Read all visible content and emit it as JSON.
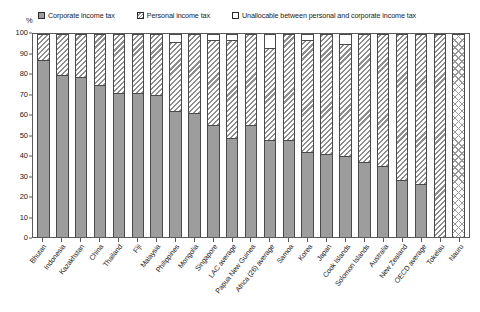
{
  "chart_data": {
    "type": "bar",
    "subtype": "stacked-100-percent",
    "title": "",
    "xlabel": "",
    "ylabel": "%",
    "ylim": [
      0,
      100
    ],
    "yticks": [
      0,
      10,
      20,
      30,
      40,
      50,
      60,
      70,
      80,
      90,
      100
    ],
    "grid": false,
    "legend_position": "top",
    "unit": "%",
    "categories": [
      "Bhutan",
      "Indonesia",
      "Kazakhstan",
      "China",
      "Thailand",
      "Fiji",
      "Malaysia",
      "Philippines",
      "Mongolia",
      "Singapore",
      "LAC average",
      "Papua New Guinea",
      "Africa (26) average",
      "Samoa",
      "Korea",
      "Japan",
      "Cook Islands",
      "Solomon Islands",
      "Australia",
      "New Zealand",
      "OECD average",
      "Tokelau",
      "Nauru"
    ],
    "series": [
      {
        "name": "Corporate income tax",
        "color": "#9d9d9d",
        "pattern": "solid",
        "values": [
          87,
          80,
          79,
          75,
          71,
          71,
          70,
          62,
          61,
          55,
          49,
          55,
          48,
          48,
          42,
          41,
          40,
          37,
          35,
          28,
          26,
          0,
          0
        ]
      },
      {
        "name": "Personal income tax",
        "color": "#ffffff",
        "pattern": "diagonal-hatch",
        "values": [
          13,
          20,
          21,
          25,
          29,
          29,
          30,
          34,
          39,
          42,
          48,
          45,
          45,
          52,
          55,
          59,
          55,
          63,
          65,
          72,
          74,
          100,
          0
        ]
      },
      {
        "name": "Unallocable between personal and corporate income tax",
        "color": "#ffffff",
        "pattern": "none",
        "values": [
          0,
          0,
          0,
          0,
          0,
          0,
          0,
          4,
          0,
          3,
          3,
          0,
          7,
          0,
          3,
          0,
          5,
          0,
          0,
          0,
          0,
          0,
          100
        ]
      }
    ]
  },
  "legend": {
    "items": [
      {
        "label": "Corporate income tax",
        "swatch": "corporate-swatch"
      },
      {
        "label": "Personal income tax",
        "swatch": "personal-swatch"
      },
      {
        "label": "Unallocable between personal and corporate income tax",
        "swatch": "unallocable-swatch"
      }
    ]
  },
  "axis": {
    "y_unit": "%",
    "y_labels": [
      "100",
      "90",
      "80",
      "70",
      "60",
      "50",
      "40",
      "30",
      "20",
      "10",
      "0"
    ]
  }
}
